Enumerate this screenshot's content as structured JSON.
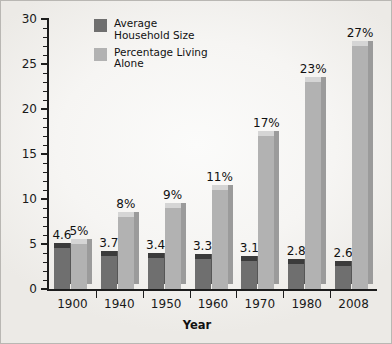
{
  "chart_data": {
    "type": "bar",
    "title": "",
    "xlabel": "Year",
    "ylabel": "",
    "categories": [
      "1900",
      "1940",
      "1950",
      "1960",
      "1970",
      "1980",
      "2008"
    ],
    "ylim": [
      0,
      30
    ],
    "yticks": [
      0,
      5,
      10,
      15,
      20,
      25,
      30
    ],
    "ytick_labels": [
      "0",
      "5",
      "10",
      "15",
      "20",
      "25",
      "30"
    ],
    "minor_tick_step": 1,
    "grid": false,
    "legend_position": "top-left-inside",
    "series": [
      {
        "name": "Average Household Size",
        "color": "#6f6f6f",
        "values": [
          4.6,
          3.7,
          3.4,
          3.3,
          3.1,
          2.8,
          2.6
        ],
        "labels": [
          "4.6",
          "3.7",
          "3.4",
          "3.3",
          "3.1",
          "2.8",
          "2.6"
        ]
      },
      {
        "name": "Percentage Living Alone",
        "color": "#b2b2b2",
        "values": [
          5,
          8,
          9,
          11,
          17,
          23,
          27
        ],
        "labels": [
          "5%",
          "8%",
          "9%",
          "11%",
          "17%",
          "23%",
          "27%"
        ]
      }
    ]
  },
  "legend": {
    "items": [
      {
        "label": "Average\nHousehold Size",
        "color": "#6f6f6f"
      },
      {
        "label": "Percentage Living\nAlone",
        "color": "#b2b2b2"
      }
    ]
  },
  "axis": {
    "x_title": "Year"
  }
}
